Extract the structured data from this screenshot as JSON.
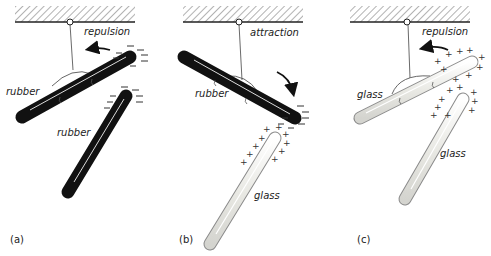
{
  "figure": {
    "colors": {
      "rubber": "#111111",
      "glass_fill": "#f1f1ee",
      "glass_edge": "#8a8a8a",
      "hatch": "#555555",
      "text": "#222222"
    },
    "panels": [
      {
        "id": "a",
        "label": "(a)",
        "interaction": "repulsion",
        "suspended_rod": {
          "material": "rubber",
          "charge": "negative",
          "charge_symbol": "−"
        },
        "held_rod": {
          "material": "rubber",
          "charge": "negative",
          "charge_symbol": "−"
        },
        "arrow_direction": "left"
      },
      {
        "id": "b",
        "label": "(b)",
        "interaction": "attraction",
        "suspended_rod": {
          "material": "rubber",
          "charge": "negative",
          "charge_symbol": "−"
        },
        "held_rod": {
          "material": "glass",
          "charge": "positive",
          "charge_symbol": "+"
        },
        "arrow_direction": "down-right"
      },
      {
        "id": "c",
        "label": "(c)",
        "interaction": "repulsion",
        "suspended_rod": {
          "material": "glass",
          "charge": "positive",
          "charge_symbol": "+"
        },
        "held_rod": {
          "material": "glass",
          "charge": "positive",
          "charge_symbol": "+"
        },
        "arrow_direction": "left"
      }
    ]
  }
}
